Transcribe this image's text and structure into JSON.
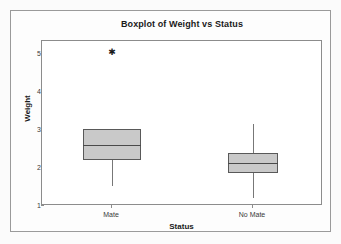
{
  "chart_data": {
    "type": "box",
    "title": "Boxplot of Weight vs Status",
    "xlabel": "Status",
    "ylabel": "Weight",
    "categories": [
      "Mate",
      "No Mate"
    ],
    "ylim": [
      1,
      5.35
    ],
    "yticks": [
      1,
      2,
      3,
      4,
      5
    ],
    "ytick_labels": [
      "1",
      "2",
      "3",
      "4",
      "5"
    ],
    "grid": false,
    "legend": null,
    "boxes": [
      {
        "category": "Mate",
        "whisker_low": 1.52,
        "q1": 2.2,
        "median": 2.61,
        "q3": 3.03,
        "whisker_high": 3.03,
        "outliers": [
          5.05
        ]
      },
      {
        "category": "No Mate",
        "whisker_low": 1.21,
        "q1": 1.86,
        "median": 2.14,
        "q3": 2.4,
        "whisker_high": 3.15,
        "outliers": []
      }
    ],
    "colors": {
      "box_fill": "#c9c9c9",
      "box_edge": "#595959",
      "median": "#4a4a4a",
      "whisker": "#777777",
      "frame": "#8c8c8c",
      "background": "#ffffff",
      "figure_background": "#fbfbfb"
    }
  }
}
